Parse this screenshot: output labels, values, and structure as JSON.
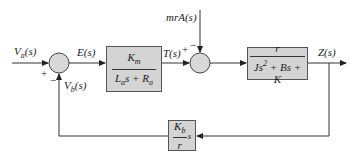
{
  "diagram": {
    "type": "block-diagram",
    "signals": {
      "input": "V_a(s)",
      "error": "E(s)",
      "torque": "T(s)",
      "disturbance": "mrA(s)",
      "output": "Z(s)",
      "back_emf": "V_b(s)"
    },
    "blocks": [
      {
        "id": "motor",
        "numerator": "K_m",
        "denominator": "L_a s + R_a"
      },
      {
        "id": "plant",
        "numerator": "r",
        "denominator": "Js^2 + Bs + K"
      },
      {
        "id": "feedback",
        "numerator": "K_b",
        "denominator": "r",
        "suffix": "s"
      }
    ],
    "junctions": [
      {
        "id": "sum1",
        "signs": {
          "input": "+",
          "feedback": "−"
        }
      },
      {
        "id": "sum2",
        "signs": {
          "input": "+",
          "disturbance": "−"
        }
      }
    ],
    "colors": {
      "block_fill": "#d4d4d4",
      "junction_fill": "#d8d8d8",
      "line": "#333333"
    }
  },
  "text": {
    "va_main": "V",
    "va_sub": "a",
    "va_tail": "(s)",
    "e": "E(s)",
    "t": "T(s)",
    "mra": "mrA(s)",
    "z": "Z(s)",
    "vb_main": "V",
    "vb_sub": "b",
    "vb_tail": "(s)",
    "plus1": "+",
    "minus1": "−",
    "plus2": "+",
    "minus2": "−",
    "km_main": "K",
    "km_sub": "m",
    "la_main": "L",
    "la_sub": "a",
    "la_mid": "s + R",
    "ra_sub": "a",
    "r_num": "r",
    "j_main": "Js",
    "j_sup": "2",
    "j_tail": " + Bs + K",
    "kb_main": "K",
    "kb_sub": "b",
    "kb_den": "r",
    "kb_s": "s"
  }
}
